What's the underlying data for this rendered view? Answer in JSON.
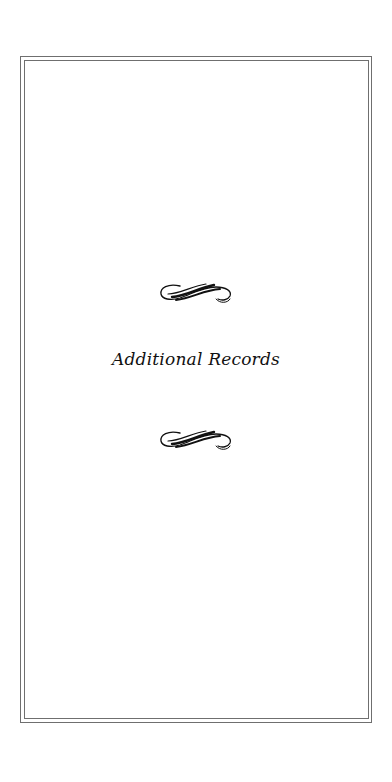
{
  "page": {
    "title": "Additional Records",
    "ornaments": [
      {
        "icon": "flourish-ornament-icon",
        "position": "above-title"
      },
      {
        "icon": "flourish-ornament-icon",
        "position": "below-title"
      }
    ],
    "colors": {
      "border": "#6f6f6f",
      "text": "#111111",
      "background": "#ffffff"
    }
  }
}
